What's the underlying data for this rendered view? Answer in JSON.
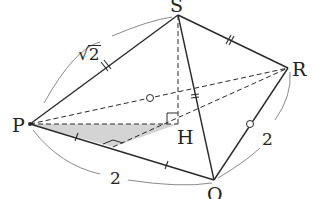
{
  "diagram": {
    "points": {
      "S": {
        "label": "S",
        "x": 178,
        "y": 15
      },
      "P": {
        "label": "P",
        "x": 30,
        "y": 124
      },
      "Q": {
        "label": "Q",
        "x": 214,
        "y": 180
      },
      "R": {
        "label": "R",
        "x": 288,
        "y": 68
      },
      "H": {
        "label": "H",
        "x": 178,
        "y": 124
      }
    },
    "labels": {
      "S": "S",
      "P": "P",
      "Q": "Q",
      "R": "R",
      "H": "H",
      "sp_length_radicand": "2",
      "sp_length_symbol": "√",
      "pq_length": "2",
      "qr_length": "2"
    },
    "edges_solid": [
      [
        "S",
        "P"
      ],
      [
        "S",
        "R"
      ],
      [
        "S",
        "Q"
      ],
      [
        "P",
        "Q"
      ],
      [
        "Q",
        "R"
      ]
    ],
    "edges_dashed": [
      [
        "P",
        "R"
      ],
      [
        "P",
        "H"
      ],
      [
        "S",
        "H"
      ],
      [
        "H",
        "R"
      ]
    ],
    "shaded_triangle": [
      "P",
      "H",
      "F"
    ],
    "foot_on_PQ": {
      "x": 113,
      "y": 147
    },
    "colors": {
      "line": "#2a2a2a",
      "arc": "#8a8a8a",
      "shade": "#d4d4d4",
      "background": "#ffffff"
    }
  }
}
